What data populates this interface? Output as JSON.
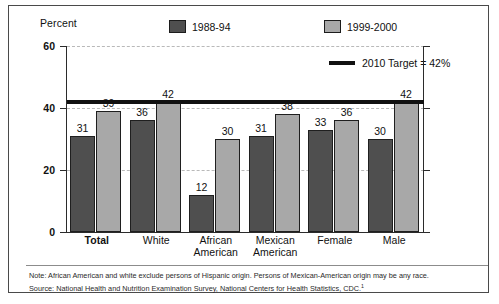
{
  "chart_data": {
    "type": "bar",
    "title": "",
    "subtitle": "",
    "xlabel": "",
    "ylabel": "Percent",
    "ylim": [
      0,
      60
    ],
    "yticks": [
      0,
      20,
      40,
      60
    ],
    "grid": true,
    "legend_position": "top",
    "categories": [
      "Total",
      "White",
      "African American",
      "Mexican American",
      "Female",
      "Male"
    ],
    "category_lines": [
      [
        "Total"
      ],
      [
        "White"
      ],
      [
        "African",
        "American"
      ],
      [
        "Mexican",
        "American"
      ],
      [
        "Female"
      ],
      [
        "Male"
      ]
    ],
    "series": [
      {
        "name": "1988-94",
        "color": "#4f4f4f",
        "values": [
          31,
          36,
          12,
          31,
          33,
          30
        ]
      },
      {
        "name": "1999-2000",
        "color": "#a8a8a8",
        "values": [
          39,
          42,
          30,
          38,
          36,
          42
        ]
      }
    ],
    "reference_line": {
      "label": "2010 Target = 42%",
      "value": 42,
      "color": "#111111"
    }
  },
  "axis": {
    "unit_label": "Percent",
    "tick_labels": [
      "60",
      "40",
      "20",
      "0"
    ]
  },
  "legend": {
    "items": [
      {
        "label": "1988-94",
        "color": "#4f4f4f"
      },
      {
        "label": "1999-2000",
        "color": "#a8a8a8"
      }
    ],
    "target_label": "2010 Target = 42%"
  },
  "notes": {
    "note": "Note: African American and white exclude persons of Hispanic origin. Persons of Mexican-American origin may be any race.",
    "source": "Source: National Health and Nutrition Examination Survey, National Centers for Health Statistics, CDC.",
    "source_superscript": "1"
  }
}
